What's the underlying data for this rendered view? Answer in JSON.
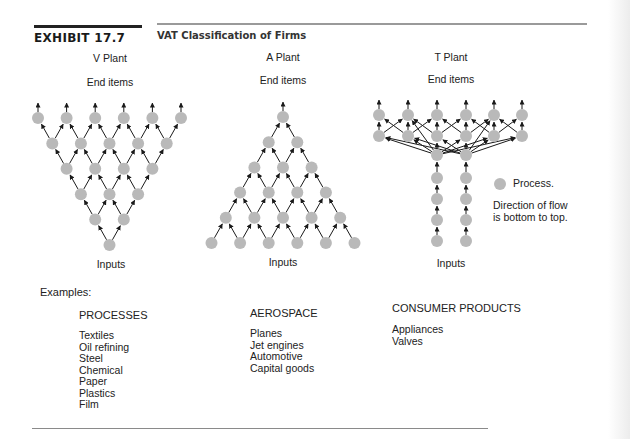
{
  "header": {
    "exhibit_label": "EXHIBIT 17.7",
    "title": "VAT Classification of Firms"
  },
  "plants": [
    {
      "id": "v",
      "name": "V Plant",
      "top_label": "End items",
      "bottom_label": "Inputs"
    },
    {
      "id": "a",
      "name": "A Plant",
      "top_label": "End items",
      "bottom_label": "Inputs"
    },
    {
      "id": "t",
      "name": "T Plant",
      "top_label": "End items",
      "bottom_label": "Inputs"
    }
  ],
  "legend": {
    "process_label": "Process.",
    "flow_note_line1": "Direction of flow",
    "flow_note_line2": "is bottom to top."
  },
  "examples": {
    "label": "Examples:",
    "groups": [
      {
        "heading": "PROCESSES",
        "items": [
          "Textiles",
          "Oil refining",
          "Steel",
          "Chemical",
          "Paper",
          "Plastics",
          "Film"
        ]
      },
      {
        "heading": "AEROSPACE",
        "items": [
          "Planes",
          "Jet engines",
          "Automotive",
          "Capital goods"
        ]
      },
      {
        "heading": "CONSUMER PRODUCTS",
        "items": [
          "Appliances",
          "Valves"
        ]
      }
    ]
  },
  "colors": {
    "node_fill": "#b9b9b9",
    "edge": "#1a1a1a",
    "rule_thick": "#222222",
    "rule_gray": "#9a9a9a"
  }
}
